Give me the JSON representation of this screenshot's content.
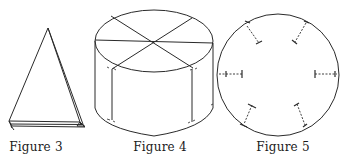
{
  "figures": [
    {
      "id": "figure-3",
      "caption": "Figure 3",
      "depicts": "folded cone / triangle"
    },
    {
      "id": "figure-4",
      "caption": "Figure 4",
      "depicts": "cylinder with divided top"
    },
    {
      "id": "figure-5",
      "caption": "Figure 5",
      "depicts": "circle with six dashed radial marks"
    }
  ],
  "colors": {
    "line": "#2a2a2a",
    "background": "#ffffff"
  }
}
